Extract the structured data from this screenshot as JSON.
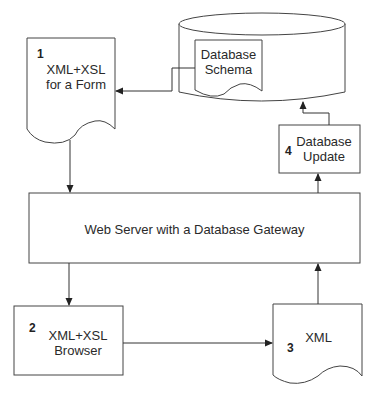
{
  "diagram": {
    "nodes": {
      "form_doc": {
        "number": "1",
        "line1": "XML+XSL",
        "line2": "for a Form"
      },
      "database": {
        "schema_line1": "Database",
        "schema_line2": "Schema"
      },
      "db_update": {
        "number": "4",
        "line1": "Database",
        "line2": "Update"
      },
      "web_server": {
        "label": "Web Server with a Database Gateway"
      },
      "browser": {
        "number": "2",
        "line1": "XML+XSL",
        "line2": "Browser"
      },
      "xml_doc": {
        "number": "3",
        "label": "XML"
      }
    },
    "edges": [
      {
        "from": "Database Schema",
        "to": "XML+XSL for a Form"
      },
      {
        "from": "XML+XSL for a Form",
        "to": "Web Server with a Database Gateway"
      },
      {
        "from": "Web Server with a Database Gateway",
        "to": "XML+XSL Browser"
      },
      {
        "from": "XML+XSL Browser",
        "to": "XML"
      },
      {
        "from": "XML",
        "to": "Web Server with a Database Gateway"
      },
      {
        "from": "Web Server with a Database Gateway",
        "to": "Database Update"
      },
      {
        "from": "Database Update",
        "to": "Database"
      }
    ]
  }
}
